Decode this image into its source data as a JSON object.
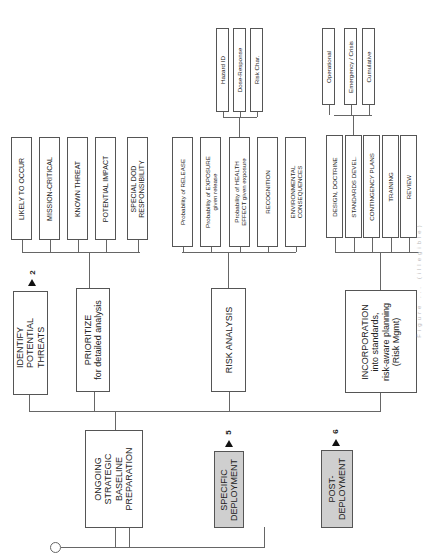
{
  "diagram": {
    "orientation": "rotated-90-ccw",
    "phases": {
      "baseline": "ONGOING\nSTRATEGIC\nBASELINE\nPREPARATION",
      "specific": "SPECIFIC\nDEPLOYMENT",
      "post": "POST-\nDEPLOYMENT",
      "specific_ref": "5",
      "post_ref": "6"
    },
    "steps": {
      "identify": "IDENTIFY\nPOTENTIAL\nTHREATS",
      "identify_ref": "2",
      "prioritize_title": "PRIORITIZE",
      "prioritize_sub": "for detailed analysis",
      "risk_analysis": "RISK ANALYSIS",
      "incorporation": "INCORPORATION\ninto standards,\nrisk-aware planning\n(Risk Mgmt)"
    },
    "prioritize_criteria": [
      "LIKELY TO OCCUR",
      "MISSION-CRITICAL",
      "KNOWN THREAT",
      "POTENTIAL IMPACT",
      "SPECIAL DOD\nRESPONSIBILITY"
    ],
    "risk_factors": [
      "Probability of RELEASE",
      "Probability of EXPOSURE\ngiven release",
      "Probability of HEALTH\nEFFECT given exposure",
      "RECOGNITION",
      "ENVIRONMENTAL\nCONSEQUENCES"
    ],
    "health_effect_substeps": [
      "Hazard ID",
      "Dose-Response",
      "Risk Char."
    ],
    "incorporation_items": [
      "DESIGN, DOCTRINE",
      "STANDARDS DEVEL.",
      "CONTINGENCY PLANS",
      "TRAINING",
      "REVIEW"
    ],
    "standards_substeps": [
      "Operational",
      "Emergency / Crisis",
      "Cumulative"
    ],
    "caption": "Figure ... (illegible)"
  }
}
